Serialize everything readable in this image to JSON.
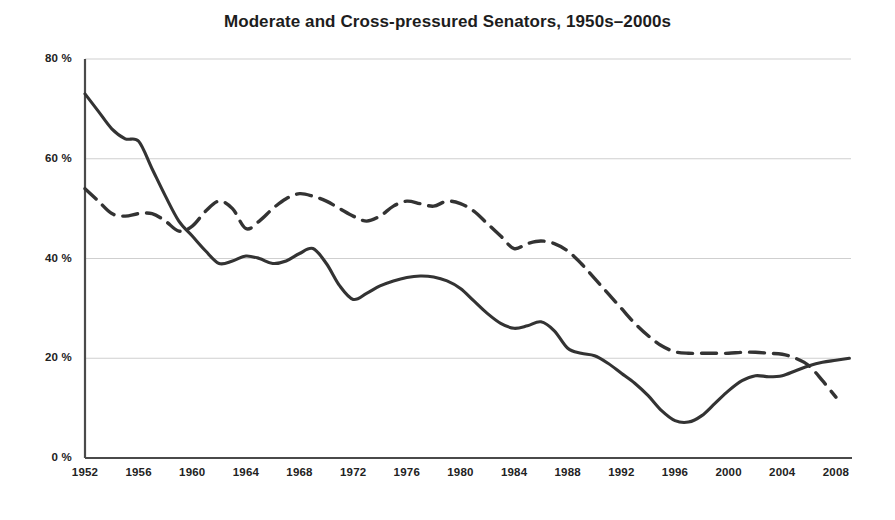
{
  "chart_data": {
    "type": "line",
    "title": "Moderate and Cross-pressured Senators, 1950s–2000s",
    "xlabel": "",
    "ylabel": "",
    "xlim": [
      1952,
      2009
    ],
    "ylim": [
      0,
      80
    ],
    "grid": true,
    "grid_axis": "y",
    "legend": "none",
    "x_tick_labels": [
      "1952",
      "1956",
      "1960",
      "1964",
      "1968",
      "1972",
      "1976",
      "1980",
      "1984",
      "1988",
      "1992",
      "1996",
      "2000",
      "2004",
      "2008"
    ],
    "x_tick_values": [
      1952,
      1956,
      1960,
      1964,
      1968,
      1972,
      1976,
      1980,
      1984,
      1988,
      1992,
      1996,
      2000,
      2004,
      2008
    ],
    "y_tick_labels": [
      "0 %",
      "20 %",
      "40 %",
      "60 %",
      "80 %"
    ],
    "y_tick_values": [
      0,
      20,
      40,
      60,
      80
    ],
    "series": [
      {
        "name": "Moderate Senators",
        "style": "solid",
        "color": "#333333",
        "x": [
          1952,
          1953,
          1954,
          1955,
          1956,
          1957,
          1958,
          1959,
          1960,
          1961,
          1962,
          1963,
          1964,
          1965,
          1966,
          1967,
          1968,
          1969,
          1970,
          1971,
          1972,
          1973,
          1974,
          1975,
          1976,
          1977,
          1978,
          1979,
          1980,
          1981,
          1982,
          1983,
          1984,
          1985,
          1986,
          1987,
          1988,
          1989,
          1990,
          1991,
          1992,
          1993,
          1994,
          1995,
          1996,
          1997,
          1998,
          1999,
          2000,
          2001,
          2002,
          2003,
          2004,
          2005,
          2006,
          2007,
          2008,
          2009
        ],
        "values": [
          73.0,
          69.5,
          66.0,
          64.0,
          63.5,
          58.0,
          52.5,
          47.5,
          44.5,
          41.5,
          39.0,
          39.5,
          40.5,
          40.0,
          39.0,
          39.5,
          41.0,
          42.0,
          39.0,
          34.5,
          31.8,
          33.0,
          34.5,
          35.5,
          36.2,
          36.5,
          36.3,
          35.5,
          34.0,
          31.5,
          29.0,
          27.0,
          26.0,
          26.5,
          27.3,
          25.5,
          22.0,
          21.0,
          20.5,
          19.0,
          17.0,
          15.0,
          12.5,
          9.5,
          7.5,
          7.2,
          8.5,
          11.0,
          13.5,
          15.5,
          16.5,
          16.3,
          16.5,
          17.5,
          18.5,
          19.2,
          19.6,
          20.0
        ]
      },
      {
        "name": "Cross-pressured Senators",
        "style": "dashed",
        "color": "#333333",
        "x": [
          1952,
          1953,
          1954,
          1955,
          1956,
          1957,
          1958,
          1959,
          1960,
          1961,
          1962,
          1963,
          1964,
          1965,
          1966,
          1967,
          1968,
          1969,
          1970,
          1971,
          1972,
          1973,
          1974,
          1975,
          1976,
          1977,
          1978,
          1979,
          1980,
          1981,
          1982,
          1983,
          1984,
          1985,
          1986,
          1987,
          1988,
          1989,
          1990,
          1991,
          1992,
          1993,
          1994,
          1995,
          1996,
          1997,
          1998,
          1999,
          2000,
          2001,
          2002,
          2003,
          2004,
          2005,
          2006,
          2007,
          2008
        ],
        "values": [
          54.0,
          51.5,
          49.0,
          48.5,
          49.0,
          49.0,
          47.5,
          45.5,
          46.5,
          49.5,
          51.5,
          50.0,
          46.0,
          47.5,
          50.0,
          52.0,
          53.0,
          52.5,
          51.5,
          50.0,
          48.5,
          47.5,
          48.5,
          50.5,
          51.5,
          51.0,
          50.5,
          51.5,
          51.0,
          49.5,
          47.0,
          44.5,
          42.0,
          43.0,
          43.5,
          43.0,
          41.5,
          39.0,
          36.0,
          33.0,
          30.0,
          27.0,
          24.5,
          22.5,
          21.3,
          21.0,
          21.0,
          21.0,
          21.0,
          21.2,
          21.2,
          21.0,
          20.8,
          20.0,
          18.5,
          15.5,
          12.2
        ]
      }
    ]
  },
  "axis": {
    "y_unit": "%",
    "x_first": "1952",
    "x_last": "2008"
  }
}
